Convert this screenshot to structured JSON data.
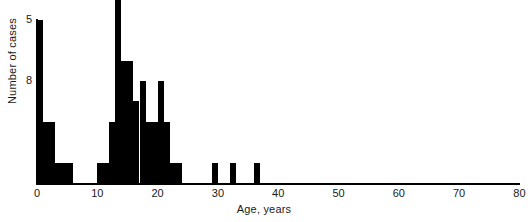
{
  "chart_data": {
    "type": "bar",
    "title": "",
    "subtitle": "",
    "xlabel": "Age, years",
    "ylabel": "Number of cases",
    "xlim": [
      0,
      81
    ],
    "ylim": [
      0,
      9
    ],
    "xticks": [
      0,
      10,
      20,
      30,
      40,
      50,
      60,
      70,
      80
    ],
    "yticks": [
      5,
      8
    ],
    "grid": false,
    "legend": null,
    "bin_width": 1,
    "note": "Histogram of number of cases by age in years; the bar at age 13 is clipped by the top edge of the figure.",
    "categories": [
      0,
      1,
      2,
      3,
      4,
      5,
      6,
      7,
      8,
      9,
      10,
      11,
      12,
      13,
      14,
      15,
      16,
      17,
      18,
      19,
      20,
      21,
      22,
      23,
      29,
      32,
      36
    ],
    "values": [
      8,
      3,
      3,
      1,
      1,
      1,
      0,
      0,
      0,
      0,
      1,
      1,
      3,
      9,
      6,
      6,
      4,
      5,
      3,
      3,
      5,
      3,
      1,
      1,
      1,
      1,
      1
    ]
  },
  "axes": {
    "ylabel_text": "Number of cases",
    "xlabel_text": "Age, years",
    "ytick_labels": [
      "8",
      "5"
    ],
    "xtick_labels": [
      "0",
      "10",
      "20",
      "30",
      "40",
      "50",
      "60",
      "70",
      "80"
    ]
  },
  "colors": {
    "bar": "#000000",
    "axis": "#000000",
    "text": "#1a1a1a",
    "background": "#ffffff"
  }
}
